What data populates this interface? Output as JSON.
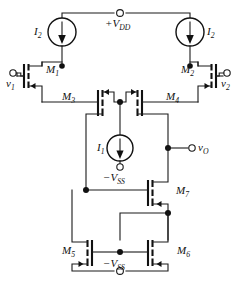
{
  "figure": {
    "type": "circuit-schematic",
    "width": 240,
    "height": 288,
    "background_color": "#ffffff",
    "line_color": "#111111"
  },
  "labels": {
    "vdd": "+V",
    "vdd_sub": "DD",
    "vss_mid": "−V",
    "vss_mid_sub": "SS",
    "vss_bottom": "−V",
    "vss_bottom_sub": "SS",
    "v1": "v",
    "v1_sub": "1",
    "v2": "v",
    "v2_sub": "2",
    "vo": "v",
    "vo_sub": "O",
    "i1": "I",
    "i1_sub": "1",
    "i2_left": "I",
    "i2_left_sub": "2",
    "i2_right": "I",
    "i2_right_sub": "2",
    "m1": "M",
    "m1_sub": "1",
    "m2": "M",
    "m2_sub": "2",
    "m3": "M",
    "m3_sub": "3",
    "m4": "M",
    "m4_sub": "4",
    "m5": "M",
    "m5_sub": "5",
    "m6": "M",
    "m6_sub": "6",
    "m7": "M",
    "m7_sub": "7"
  },
  "terminals": [
    {
      "name": "vdd-terminal",
      "label": "+V_DD",
      "x": 120,
      "y": 13
    },
    {
      "name": "v1-terminal",
      "label": "v_1",
      "x": 13,
      "y": 73
    },
    {
      "name": "v2-terminal",
      "label": "v_2",
      "x": 227,
      "y": 73
    },
    {
      "name": "vo-terminal",
      "label": "v_O",
      "x": 192,
      "y": 148
    },
    {
      "name": "vss-mid-terminal",
      "label": "-V_SS",
      "x": 120,
      "y": 167
    },
    {
      "name": "vss-bottom-terminal",
      "label": "-V_SS",
      "x": 120,
      "y": 277
    }
  ],
  "current_sources": [
    {
      "name": "i2-left-source",
      "label": "I_2",
      "cx": 62,
      "cy": 32,
      "r": 14,
      "direction": "down"
    },
    {
      "name": "i2-right-source",
      "label": "I_2",
      "cx": 190,
      "cy": 32,
      "r": 14,
      "direction": "down"
    },
    {
      "name": "i1-source",
      "label": "I_1",
      "cx": 120,
      "cy": 148,
      "r": 13,
      "direction": "down"
    }
  ],
  "transistors": [
    {
      "name": "transistor-m1",
      "label": "M_1",
      "type": "pmos",
      "orientation": "gate-left"
    },
    {
      "name": "transistor-m2",
      "label": "M_2",
      "type": "pmos",
      "orientation": "gate-right"
    },
    {
      "name": "transistor-m3",
      "label": "M_3",
      "type": "pmos",
      "orientation": "gate-left"
    },
    {
      "name": "transistor-m4",
      "label": "M_4",
      "type": "pmos",
      "orientation": "gate-right"
    },
    {
      "name": "transistor-m5",
      "label": "M_5",
      "type": "nmos",
      "orientation": "gate-right"
    },
    {
      "name": "transistor-m6",
      "label": "M_6",
      "type": "nmos",
      "orientation": "gate-left"
    },
    {
      "name": "transistor-m7",
      "label": "M_7",
      "type": "nmos",
      "orientation": "gate-left"
    }
  ],
  "nodes": [
    {
      "name": "node-i2-left-drain",
      "x": 62,
      "y": 66
    },
    {
      "name": "node-center-tail",
      "x": 120,
      "y": 102
    },
    {
      "name": "node-i2-right-drain",
      "x": 190,
      "y": 66
    },
    {
      "name": "node-vo",
      "x": 168,
      "y": 148
    },
    {
      "name": "node-m7-gate-left",
      "x": 50,
      "y": 190
    },
    {
      "name": "node-m7-source",
      "x": 168,
      "y": 213
    },
    {
      "name": "node-mirror-gate",
      "x": 120,
      "y": 252
    }
  ]
}
